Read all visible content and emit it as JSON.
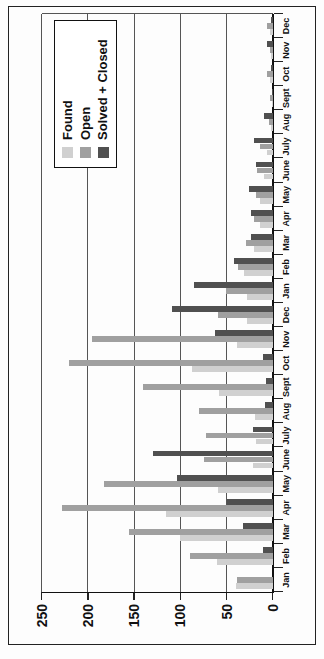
{
  "figure": {
    "background": "#ffffff",
    "border_color": "#222222",
    "gridline_color": "#555555",
    "axis_color": "#111111",
    "rotation_note": "landscape chart rotated 90 degrees counter-clockwise"
  },
  "chart_data": {
    "type": "bar",
    "title": "",
    "xlabel": "",
    "ylabel": "",
    "ylim": [
      0,
      250
    ],
    "yticks": [
      0,
      50,
      100,
      150,
      200,
      250
    ],
    "grid": "horizontal gridlines at each ytick",
    "legend_position": "top-right",
    "categories": [
      "Jan",
      "Feb",
      "Mar",
      "Apr",
      "May",
      "June",
      "July",
      "Aug",
      "Sept",
      "Oct",
      "Nov",
      "Dec",
      "Jan",
      "Feb",
      "Mar",
      "Apr",
      "May",
      "June",
      "July",
      "Aug",
      "Sept",
      "Oct",
      "Nov",
      "Dec"
    ],
    "series": [
      {
        "name": "Found",
        "color": "#d0d0d0",
        "values": [
          40,
          60,
          100,
          115,
          59,
          21,
          18,
          19,
          58,
          87,
          39,
          28,
          28,
          31,
          20,
          14,
          14,
          9,
          6,
          2,
          1,
          3,
          2,
          3
        ]
      },
      {
        "name": "Open",
        "color": "#a0a0a0",
        "values": [
          39,
          89,
          155,
          228,
          183,
          74,
          72,
          80,
          140,
          220,
          196,
          59,
          51,
          38,
          29,
          20,
          18,
          17,
          14,
          4,
          3,
          6,
          3,
          6
        ]
      },
      {
        "name": "Solved + Closed",
        "color": "#505050",
        "values": [
          0,
          11,
          32,
          50,
          104,
          130,
          21,
          8,
          7,
          10,
          62,
          109,
          85,
          42,
          24,
          23,
          26,
          18,
          20,
          9,
          1,
          2,
          6,
          2
        ]
      }
    ]
  }
}
